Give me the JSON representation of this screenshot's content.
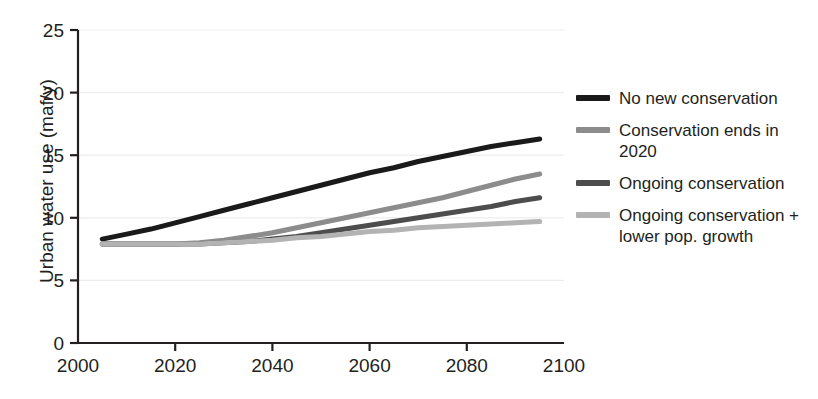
{
  "chart_data": {
    "type": "line",
    "title": "",
    "xlabel": "",
    "ylabel": "Urban water use (maf/y)",
    "xlim": [
      2000,
      2100
    ],
    "ylim": [
      0,
      25
    ],
    "xticks": [
      2000,
      2020,
      2040,
      2060,
      2080,
      2100
    ],
    "yticks": [
      0,
      5,
      10,
      15,
      20,
      25
    ],
    "grid": "horizontal",
    "legend_position": "right",
    "x": [
      2005,
      2010,
      2015,
      2020,
      2025,
      2030,
      2035,
      2040,
      2045,
      2050,
      2055,
      2060,
      2065,
      2070,
      2075,
      2080,
      2085,
      2090,
      2095
    ],
    "series": [
      {
        "name": "No new conservation",
        "color": "#1a1a1a",
        "values": [
          8.3,
          8.7,
          9.1,
          9.6,
          10.1,
          10.6,
          11.1,
          11.6,
          12.1,
          12.6,
          13.1,
          13.6,
          14.0,
          14.5,
          14.9,
          15.3,
          15.7,
          16.0,
          16.3
        ]
      },
      {
        "name": "Conservation ends in 2020",
        "color": "#8c8c8c",
        "values": [
          7.9,
          7.9,
          7.9,
          7.9,
          8.0,
          8.2,
          8.5,
          8.8,
          9.2,
          9.6,
          10.0,
          10.4,
          10.8,
          11.2,
          11.6,
          12.1,
          12.6,
          13.1,
          13.5
        ]
      },
      {
        "name": "Ongoing conservation",
        "color": "#4d4d4d",
        "values": [
          7.9,
          7.9,
          7.9,
          7.9,
          7.9,
          8.0,
          8.1,
          8.3,
          8.5,
          8.8,
          9.1,
          9.4,
          9.7,
          10.0,
          10.3,
          10.6,
          10.9,
          11.3,
          11.6
        ]
      },
      {
        "name": "Ongoing conservation + lower pop. growth",
        "color": "#b3b3b3",
        "values": [
          7.9,
          7.9,
          7.9,
          7.9,
          7.9,
          8.0,
          8.1,
          8.2,
          8.4,
          8.5,
          8.7,
          8.9,
          9.0,
          9.2,
          9.3,
          9.4,
          9.5,
          9.6,
          9.7
        ]
      }
    ]
  },
  "legend": {
    "items": [
      {
        "label": "No new conservation",
        "color": "#1a1a1a"
      },
      {
        "label": "Conservation ends in 2020",
        "color": "#8c8c8c"
      },
      {
        "label": "Ongoing conservation",
        "color": "#4d4d4d"
      },
      {
        "label": "Ongoing conservation + lower pop. growth",
        "color": "#b3b3b3"
      }
    ]
  },
  "axes": {
    "y_title": "Urban water use (maf/y)",
    "y_tick_labels": [
      "0",
      "5",
      "10",
      "15",
      "20",
      "25"
    ],
    "x_tick_labels": [
      "2000",
      "2020",
      "2040",
      "2060",
      "2080",
      "2100"
    ]
  }
}
